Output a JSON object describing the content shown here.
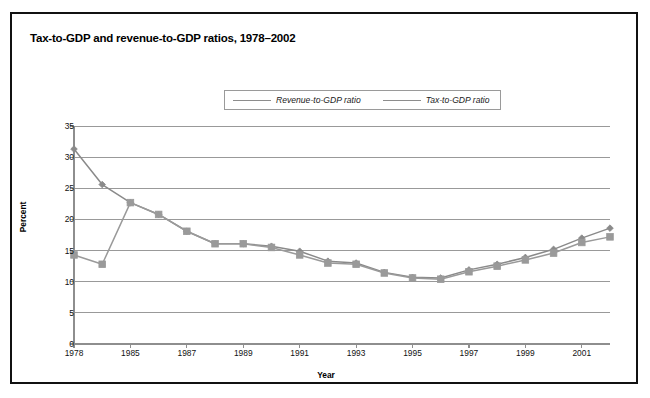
{
  "figure": {
    "title": "Tax-to-GDP and revenue-to-GDP ratios, 1978–2002"
  },
  "chart_data": {
    "type": "line",
    "title": "Tax-to-GDP and revenue-to-GDP ratios, 1978–2002",
    "xlabel": "Year",
    "ylabel": "Percent",
    "ylim": [
      0,
      35
    ],
    "ytick_values": [
      0,
      5,
      10,
      15,
      20,
      25,
      30,
      35
    ],
    "xtick_labels": [
      "1978",
      "1985",
      "1987",
      "1989",
      "1991",
      "1993",
      "1995",
      "1997",
      "1999",
      "2001"
    ],
    "x": [
      "1978",
      "1983",
      "1985",
      "1986",
      "1987",
      "1988",
      "1989",
      "1990",
      "1991",
      "1992",
      "1993",
      "1994",
      "1995",
      "1996",
      "1997",
      "1998",
      "1999",
      "2000",
      "2001",
      "2002"
    ],
    "grid": "horizontal",
    "legend_position": "top-center",
    "series": [
      {
        "name": "Revenue-to-GDP ratio",
        "marker": "diamond",
        "color": "#8a8a8a",
        "values": [
          31.3,
          25.6,
          22.7,
          20.8,
          18.1,
          16.1,
          16.1,
          15.7,
          14.9,
          13.3,
          13.0,
          11.5,
          10.7,
          10.6,
          11.9,
          12.8,
          13.9,
          15.2,
          17.0,
          18.6
        ]
      },
      {
        "name": "Tax-to-GDP ratio",
        "marker": "square",
        "color": "#9a9a9a",
        "values": [
          14.3,
          12.8,
          22.7,
          20.8,
          18.1,
          16.1,
          16.1,
          15.5,
          14.3,
          13.0,
          12.8,
          11.4,
          10.6,
          10.4,
          11.6,
          12.5,
          13.5,
          14.6,
          16.3,
          17.2
        ]
      }
    ]
  },
  "legend": {
    "entries": [
      {
        "label": "Revenue-to-GDP ratio",
        "marker": "diamond-marker-icon"
      },
      {
        "label": "Tax-to-GDP ratio",
        "marker": "square-marker-icon"
      }
    ]
  },
  "axes": {
    "ylabel": "Percent",
    "xlabel": "Year"
  }
}
